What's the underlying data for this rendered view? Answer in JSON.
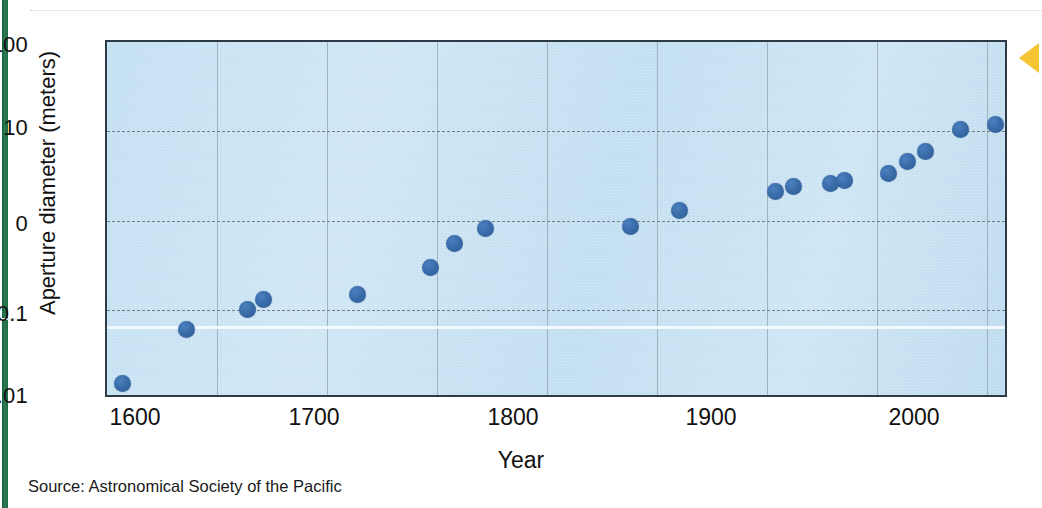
{
  "figure": {
    "source_note": "Source: Astronomical Society of the Pacific",
    "marker_icon": "left-arrow-icon",
    "accent_color": "#f5c432",
    "point_color": "#3a6ca9",
    "plot_background": "#c7e2f3",
    "edge_bar_color": "#1d6b44"
  },
  "chart_data": {
    "type": "scatter",
    "title": "",
    "xlabel": "Year",
    "ylabel": "Aperture diameter (meters)",
    "xlim": [
      1600,
      2010
    ],
    "ylim": [
      0.01,
      100
    ],
    "yscale": "log",
    "grid": true,
    "legend": null,
    "xticks": [
      {
        "label": "1600",
        "value": 1600
      },
      {
        "label": "1700",
        "value": 1700
      },
      {
        "label": "1800",
        "value": 1800
      },
      {
        "label": "1900",
        "value": 1900
      },
      {
        "label": "2000",
        "value": 2000
      }
    ],
    "yticks": [
      {
        "label": "100",
        "value": 100
      },
      {
        "label": "10",
        "value": 10
      },
      {
        "label": "0",
        "value": 1
      },
      {
        "label": "0.1",
        "value": 0.1
      },
      {
        "label": "0.01",
        "value": 0.01
      }
    ],
    "x_minor_gridlines": [
      1650,
      1700,
      1750,
      1800,
      1850,
      1900,
      1950,
      2000
    ],
    "points": [
      {
        "x": 1607,
        "y": 0.015
      },
      {
        "x": 1636,
        "y": 0.06
      },
      {
        "x": 1664,
        "y": 0.1
      },
      {
        "x": 1671,
        "y": 0.13
      },
      {
        "x": 1714,
        "y": 0.15
      },
      {
        "x": 1747,
        "y": 0.3
      },
      {
        "x": 1758,
        "y": 0.55
      },
      {
        "x": 1772,
        "y": 0.82
      },
      {
        "x": 1838,
        "y": 0.85
      },
      {
        "x": 1860,
        "y": 1.3
      },
      {
        "x": 1904,
        "y": 2.1
      },
      {
        "x": 1912,
        "y": 2.4
      },
      {
        "x": 1929,
        "y": 2.6
      },
      {
        "x": 1935,
        "y": 2.8
      },
      {
        "x": 1955,
        "y": 3.4
      },
      {
        "x": 1964,
        "y": 4.6
      },
      {
        "x": 1972,
        "y": 6.0
      },
      {
        "x": 1988,
        "y": 10.5
      },
      {
        "x": 2004,
        "y": 12.0
      }
    ]
  }
}
